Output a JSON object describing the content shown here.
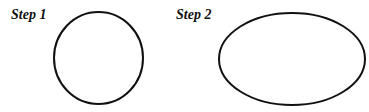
{
  "diagram": {
    "steps": [
      {
        "label": "Step 1",
        "shape": "circle",
        "center": [
          98.5,
          58
        ],
        "rx": 44.5,
        "ry": 46
      },
      {
        "label": "Step 2",
        "shape": "ellipse",
        "center": [
          292,
          59
        ],
        "rx": 73,
        "ry": 46
      }
    ],
    "stroke_color": "#111111",
    "stroke_width": 2,
    "background": "#ffffff"
  }
}
